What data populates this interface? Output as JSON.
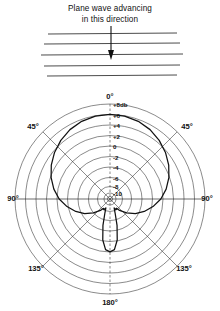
{
  "figure": {
    "caption_line1": "Plane wave advancing",
    "caption_line2": "in this direction",
    "arrow_icon": "down-arrow-icon",
    "plane_wave_line_count": 5
  },
  "chart_data": {
    "type": "line",
    "plot_kind": "polar-radiation-pattern",
    "title": "Plane wave advancing in this direction",
    "angle_unit": "degrees",
    "value_unit": "db",
    "angle_labels": [
      "0°",
      "45°",
      "45°",
      "90°",
      "90°",
      "135°",
      "135°",
      "180°"
    ],
    "radial_tick_labels": [
      "+8db",
      "+6",
      "+4",
      "+2",
      "0",
      "-2",
      "-4",
      "-6",
      "-8",
      "-10"
    ],
    "radial_ticks": [
      8,
      6,
      4,
      2,
      0,
      -2,
      -4,
      -6,
      -8,
      -10
    ],
    "rlim": [
      -10,
      8
    ],
    "ring_count": 10,
    "grid": true,
    "legend": "none",
    "spokes_deg": [
      0,
      45,
      90,
      135,
      180,
      225,
      270,
      315
    ],
    "series": [
      {
        "name": "directivity",
        "x": [
          0,
          10,
          20,
          30,
          40,
          50,
          60,
          70,
          80,
          90,
          100,
          110,
          120,
          130,
          140,
          145,
          150,
          155,
          160,
          165,
          170,
          175,
          180
        ],
        "values": [
          6.0,
          5.9,
          5.6,
          5.1,
          4.4,
          3.6,
          2.7,
          1.7,
          0.6,
          -0.6,
          -2.0,
          -3.4,
          -4.8,
          -6.3,
          -7.6,
          -8.3,
          -8.1,
          -8.6,
          -7.6,
          -5.2,
          -2.4,
          -0.6,
          -0.2
        ]
      }
    ],
    "xlabel": "",
    "ylabel": "db"
  }
}
